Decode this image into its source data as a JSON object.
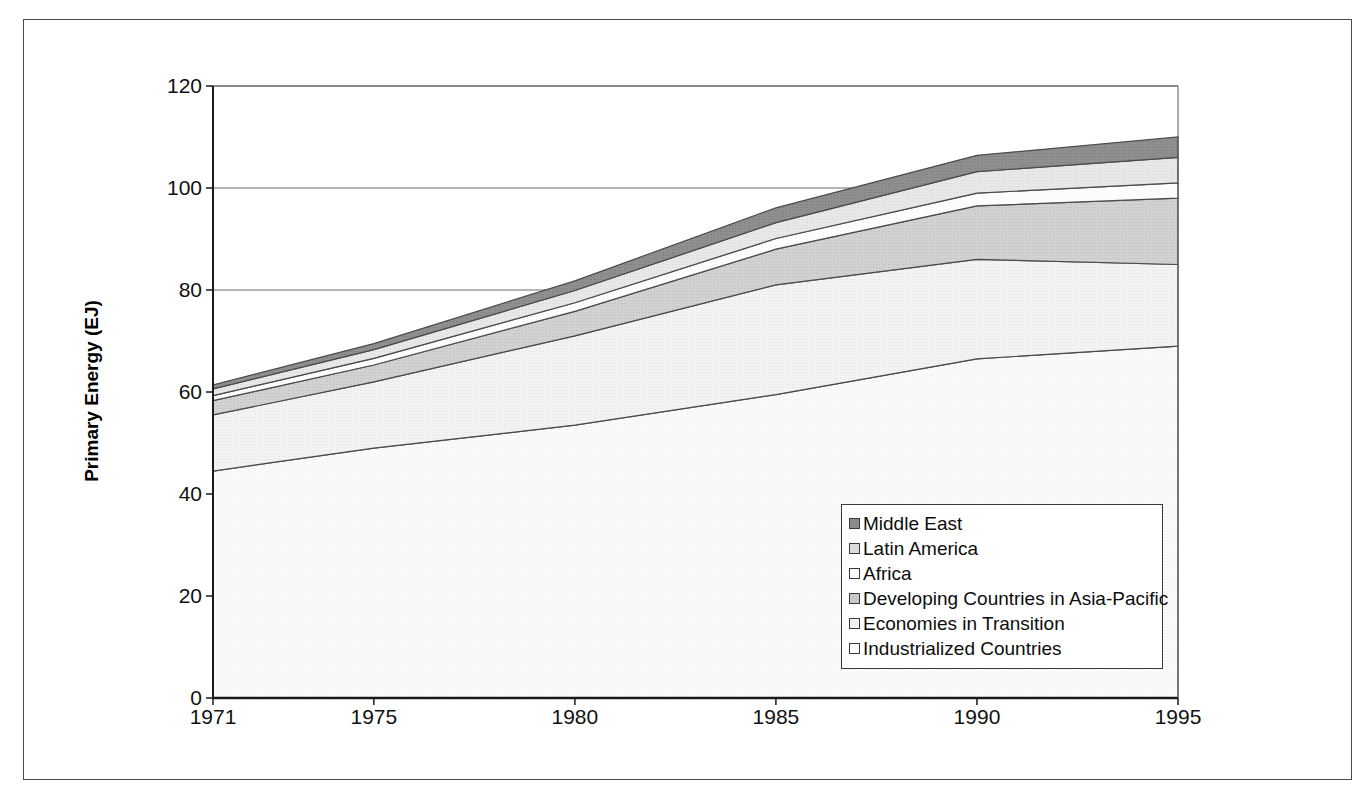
{
  "chart_data": {
    "type": "area",
    "title": "",
    "xlabel": "",
    "ylabel": "Primary Energy (EJ)",
    "x": [
      1971,
      1975,
      1980,
      1985,
      1990,
      1995
    ],
    "xtick_labels": [
      "1971",
      "1975",
      "1980",
      "1985",
      "1990",
      "1995"
    ],
    "ytick_labels": [
      "0",
      "20",
      "40",
      "60",
      "80",
      "100",
      "120"
    ],
    "ytick_values": [
      0,
      20,
      40,
      60,
      80,
      100,
      120
    ],
    "ylim": [
      0,
      120
    ],
    "xlim": [
      1971,
      1995
    ],
    "grid": "horizontal",
    "stacked": true,
    "legend_position": "inside-lower-right",
    "series": [
      {
        "name": "Industrialized Countries",
        "color": "#f5f5f5",
        "values": [
          44.5,
          49.0,
          53.5,
          59.5,
          66.5,
          69.0
        ]
      },
      {
        "name": "Economies in Transition",
        "color": "#ebebeb",
        "values": [
          11.0,
          13.0,
          17.5,
          21.5,
          19.5,
          16.0
        ]
      },
      {
        "name": "Developing Countries in Asia-Pacific",
        "color": "#cfcfcf",
        "values": [
          2.8,
          3.3,
          4.8,
          7.0,
          10.5,
          13.0
        ]
      },
      {
        "name": "Africa",
        "color": "#fbfbfb",
        "values": [
          1.0,
          1.3,
          1.7,
          2.1,
          2.5,
          3.0
        ]
      },
      {
        "name": "Latin America",
        "color": "#e2e2e2",
        "values": [
          1.3,
          1.7,
          2.4,
          3.1,
          4.2,
          5.0
        ]
      },
      {
        "name": "Middle East",
        "color": "#8c8c8c",
        "values": [
          0.8,
          1.2,
          1.9,
          2.9,
          3.2,
          4.0
        ]
      }
    ],
    "totals": [
      61.4,
      69.5,
      81.8,
      96.1,
      106.4,
      110.0
    ]
  },
  "legend": {
    "items": [
      {
        "label": "Middle East",
        "swatch": "#8c8c8c"
      },
      {
        "label": "Latin America",
        "swatch": "#dcdcdc"
      },
      {
        "label": "Africa",
        "swatch": "#fdfdfd"
      },
      {
        "label": "Developing Countries in Asia-Pacific",
        "swatch": "#c8c8c8"
      },
      {
        "label": "Economies in Transition",
        "swatch": "#f0f0f0"
      },
      {
        "label": "Industrialized Countries",
        "swatch": "#fefefe"
      }
    ]
  },
  "axis": {
    "y_title": "Primary Energy (EJ)"
  }
}
